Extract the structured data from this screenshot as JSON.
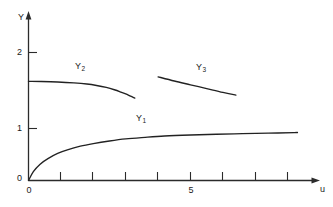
{
  "chart_data": {
    "type": "line",
    "title": "",
    "xlabel": "u",
    "ylabel": "Y",
    "xlim": [
      0,
      9.5
    ],
    "ylim": [
      0,
      2.45
    ],
    "grid": false,
    "legend": "inline-curve-labels",
    "x_ticks": [
      0,
      1,
      2,
      3,
      4,
      5,
      6,
      7,
      8,
      9
    ],
    "x_tick_labels": [
      "0",
      "",
      "",
      "",
      "",
      "5",
      "",
      "",
      "",
      ""
    ],
    "y_ticks": [
      0,
      1,
      2
    ],
    "y_tick_labels": [
      "0",
      "1",
      "2"
    ],
    "series": [
      {
        "name": "Y1",
        "label_text": "Y",
        "label_sub": "1",
        "note": "saturating rise from origin toward asymptote ~0.93",
        "x": [
          0.0,
          0.15,
          0.35,
          0.6,
          0.9,
          1.2,
          1.6,
          2.0,
          2.5,
          3.0,
          3.6,
          4.2,
          5.0,
          5.8,
          6.6,
          7.4,
          8.2,
          8.3
        ],
        "y": [
          0.0,
          0.17,
          0.31,
          0.42,
          0.52,
          0.59,
          0.66,
          0.71,
          0.76,
          0.8,
          0.83,
          0.855,
          0.875,
          0.89,
          0.9,
          0.91,
          0.92,
          0.925
        ]
      },
      {
        "name": "Y2",
        "label_text": "Y",
        "label_sub": "2",
        "note": "flat near 1.62 then bending down past u=2.3",
        "x": [
          0.0,
          0.4,
          0.9,
          1.4,
          1.8,
          2.1,
          2.4,
          2.65,
          2.85,
          3.0,
          3.15,
          3.28
        ],
        "y": [
          1.62,
          1.618,
          1.612,
          1.6,
          1.585,
          1.566,
          1.54,
          1.51,
          1.48,
          1.455,
          1.425,
          1.4
        ]
      },
      {
        "name": "Y3",
        "label_text": "Y",
        "label_sub": "3",
        "note": "detached descending branch from u=4.0 to u=6.4",
        "x": [
          4.0,
          4.5,
          5.0,
          5.5,
          6.0,
          6.4
        ],
        "y": [
          1.68,
          1.625,
          1.575,
          1.525,
          1.475,
          1.44
        ]
      }
    ],
    "colors": {
      "curve": "#222222",
      "axis": "#2b2b2b",
      "background": "#ffffff"
    }
  },
  "axes": {
    "y_axis_name": "Y",
    "x_axis_name": "u",
    "y_labels": {
      "two": "2",
      "one": "1",
      "zero": "0"
    },
    "x_labels": {
      "zero": "0",
      "five": "5"
    }
  },
  "curve_labels": {
    "y1": {
      "base": "Y",
      "sub": "1"
    },
    "y2": {
      "base": "Y",
      "sub": "2"
    },
    "y3": {
      "base": "Y",
      "sub": "3"
    }
  }
}
